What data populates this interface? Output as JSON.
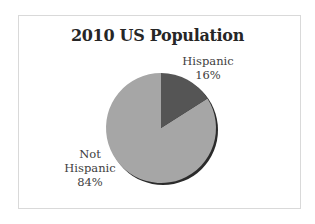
{
  "chart_data": {
    "type": "pie",
    "title": "2010 US Population",
    "categories": [
      "Hispanic",
      "Not Hispanic"
    ],
    "values": [
      16,
      84
    ],
    "unit": "%",
    "data_labels": [
      "Hispanic\n16%",
      "Not\nHispanic\n84%"
    ],
    "colors": [
      "#555555",
      "#a6a6a6"
    ],
    "start_angle": "12 o'clock, clockwise",
    "legend": "none (category labels shown next to slices)",
    "style": "3D-shadowed pie"
  },
  "chart": {
    "title": "2010 US Population",
    "slices": [
      {
        "label_line1": "Hispanic",
        "label_line2": "16%",
        "label_line3": ""
      },
      {
        "label_line1": "Not",
        "label_line2": "Hispanic",
        "label_line3": "84%"
      }
    ]
  }
}
